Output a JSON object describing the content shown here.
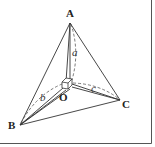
{
  "diagram": {
    "title": "",
    "points": {
      "A": {
        "label": "A",
        "x": 70,
        "y": 23
      },
      "B": {
        "label": "B",
        "x": 20,
        "y": 125
      },
      "C": {
        "label": "C",
        "x": 120,
        "y": 100
      },
      "O": {
        "label": "O",
        "x": 67,
        "y": 87
      }
    },
    "edges": [
      {
        "from": "A",
        "to": "B"
      },
      {
        "from": "A",
        "to": "C"
      },
      {
        "from": "B",
        "to": "C"
      },
      {
        "from": "O",
        "to": "A"
      },
      {
        "from": "O",
        "to": "B"
      },
      {
        "from": "O",
        "to": "C"
      }
    ],
    "lengths": {
      "a": {
        "label": "a",
        "between": [
          "O",
          "A"
        ]
      },
      "b": {
        "label": "b",
        "between": [
          "O",
          "B"
        ]
      },
      "c": {
        "label": "c",
        "between": [
          "O",
          "C"
        ]
      }
    },
    "annotations": {
      "right_angle_marker": "cube at O (OA, OB, OC mutually perpendicular)"
    },
    "colors": {
      "line": "#333333",
      "border": "#555555",
      "background": "#ffffff"
    }
  }
}
